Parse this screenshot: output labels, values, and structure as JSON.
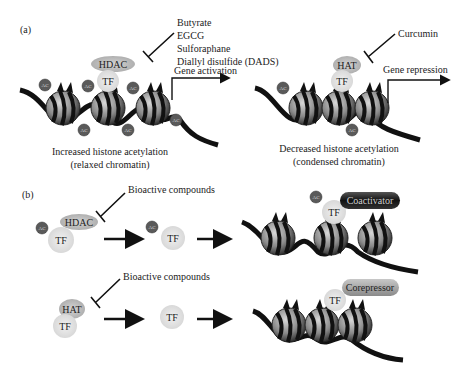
{
  "panel_a": {
    "label": "(a)",
    "left": {
      "inhibitors": [
        "Butyrate",
        "EGCG",
        "Sulforaphane",
        "Diallyl disulfide (DADS)"
      ],
      "enzyme": "HDAC",
      "tf": "TF",
      "arrow_label": "Gene activation",
      "caption_line1": "Increased histone acetylation",
      "caption_line2": "(relaxed chromatin)",
      "ac_tag": "AC"
    },
    "right": {
      "inhibitors": [
        "Curcumin"
      ],
      "enzyme": "HAT",
      "tf": "TF",
      "arrow_label": "Gene repression",
      "caption_line1": "Decreased histone acetylation",
      "caption_line2": "(condensed chromatin)",
      "ac_tag": "AC"
    }
  },
  "panel_b": {
    "label": "(b)",
    "top_row": {
      "inhibitor": "Bioactive compounds",
      "enzyme": "HDAC",
      "tf": "TF",
      "ac_tag": "AC",
      "cofactor": "Coactivator"
    },
    "bottom_row": {
      "inhibitor": "Bioactive compounds",
      "enzyme": "HAT",
      "tf": "TF",
      "cofactor": "Corepressor"
    }
  },
  "colors": {
    "dna": "#111111",
    "nucleosome_light": "#b8b8b8",
    "nucleosome_dark": "#3a3a3a",
    "ac_tag": "#555555",
    "tf_blob": "#e2e2e2",
    "enzyme_blob": "#c4c4c4",
    "coactivator": "#1a1a1a",
    "corepressor": "#9a9a9a"
  }
}
